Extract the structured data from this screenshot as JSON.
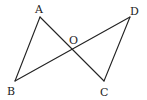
{
  "diagram": {
    "type": "geometry",
    "points": {
      "A": {
        "label": "A",
        "x": 40,
        "y": 17,
        "lx": 35,
        "ly": 13
      },
      "B": {
        "label": "B",
        "x": 15,
        "y": 81,
        "lx": 7,
        "ly": 95
      },
      "C": {
        "label": "C",
        "x": 104,
        "y": 81,
        "lx": 100,
        "ly": 96
      },
      "D": {
        "label": "D",
        "x": 130,
        "y": 17,
        "lx": 130,
        "ly": 15
      },
      "O": {
        "label": "O",
        "x": 72,
        "y": 49,
        "lx": 69,
        "ly": 44
      }
    },
    "segments": [
      {
        "name": "AB",
        "from": "A",
        "to": "B"
      },
      {
        "name": "AC",
        "from": "A",
        "to": "C"
      },
      {
        "name": "BD",
        "from": "B",
        "to": "D"
      },
      {
        "name": "DC",
        "from": "D",
        "to": "C"
      }
    ],
    "intersection": {
      "point": "O",
      "of": [
        "AC",
        "BD"
      ]
    }
  }
}
